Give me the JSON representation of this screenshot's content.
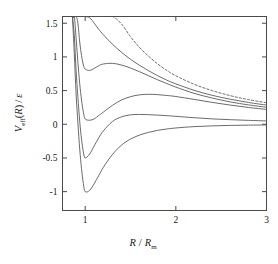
{
  "chart_data": {
    "type": "line",
    "title": "",
    "xlabel": "R / R_m",
    "ylabel": "V_eff(R) / ε",
    "xlim": [
      0.75,
      3.0
    ],
    "ylim": [
      -1.28,
      1.6
    ],
    "grid": false,
    "legend": "none",
    "xticks": [
      1,
      2,
      3
    ],
    "xticklabels": [
      "1",
      "2",
      "3"
    ],
    "yticks": [
      -1,
      -0.5,
      0,
      0.5,
      1,
      1.5
    ],
    "yticklabels": [
      "-1",
      "-0.5",
      "0",
      "0.5",
      "1",
      "1.5"
    ],
    "x": [
      0.86,
      0.88,
      0.9,
      0.92,
      0.94,
      0.96,
      0.98,
      1.0,
      1.05,
      1.1,
      1.15,
      1.2,
      1.3,
      1.4,
      1.5,
      1.6,
      1.7,
      1.8,
      1.9,
      2.0,
      2.2,
      2.4,
      2.6,
      2.8,
      3.0
    ],
    "series": [
      {
        "name": "L = 0 (no centrifugal barrier)",
        "style": "solid",
        "values": [
          1.6,
          1.05,
          0.45,
          0.02,
          -0.37,
          -0.66,
          -0.88,
          -1.0,
          -0.98,
          -0.88,
          -0.76,
          -0.64,
          -0.45,
          -0.31,
          -0.22,
          -0.16,
          -0.12,
          -0.09,
          -0.07,
          -0.055,
          -0.035,
          -0.024,
          -0.017,
          -0.013,
          -0.01
        ]
      },
      {
        "name": "L = 1",
        "style": "solid",
        "values": [
          1.6,
          1.32,
          0.8,
          0.4,
          0.04,
          -0.22,
          -0.41,
          -0.5,
          -0.44,
          -0.32,
          -0.2,
          -0.1,
          0.04,
          0.11,
          0.14,
          0.146,
          0.143,
          0.136,
          0.128,
          0.118,
          0.098,
          0.08,
          0.068,
          0.058,
          0.05
        ]
      },
      {
        "name": "L = 2",
        "style": "solid",
        "values": [
          1.6,
          1.6,
          1.28,
          0.92,
          0.6,
          0.36,
          0.18,
          0.08,
          0.06,
          0.08,
          0.13,
          0.18,
          0.28,
          0.36,
          0.41,
          0.437,
          0.445,
          0.44,
          0.428,
          0.412,
          0.37,
          0.325,
          0.285,
          0.25,
          0.22
        ]
      },
      {
        "name": "L = 3",
        "style": "solid",
        "values": [
          1.6,
          1.6,
          1.6,
          1.5,
          1.22,
          1.02,
          0.88,
          0.82,
          0.8,
          0.83,
          0.87,
          0.895,
          0.905,
          0.88,
          0.835,
          0.78,
          0.72,
          0.66,
          0.605,
          0.552,
          0.46,
          0.39,
          0.332,
          0.288,
          0.252
        ]
      },
      {
        "name": "L = 4",
        "style": "solid",
        "values": [
          1.6,
          1.6,
          1.6,
          1.6,
          1.6,
          1.6,
          1.6,
          1.6,
          1.58,
          1.5,
          1.41,
          1.33,
          1.19,
          1.07,
          0.965,
          0.875,
          0.795,
          0.72,
          0.655,
          0.6,
          0.505,
          0.43,
          0.372,
          0.324,
          0.285
        ]
      },
      {
        "name": "centrifugal term only (L = 4)",
        "style": "dashed",
        "values": [
          1.6,
          1.6,
          1.6,
          1.6,
          1.6,
          1.6,
          1.6,
          1.6,
          1.6,
          1.6,
          1.6,
          1.6,
          1.6,
          1.49,
          1.3,
          1.14,
          1.01,
          0.895,
          0.8,
          0.72,
          0.595,
          0.5,
          0.425,
          0.366,
          0.32
        ]
      }
    ]
  },
  "axes": {
    "x_label_main": "R",
    "x_label_slash": "/",
    "x_label_denom": "R",
    "x_label_sub": "m",
    "y_label_v": "V",
    "y_label_vsub": "eff",
    "y_label_paren_open": "(",
    "y_label_r": "R",
    "y_label_paren_close": ")",
    "y_label_slash": "/",
    "y_label_eps": "ε"
  }
}
